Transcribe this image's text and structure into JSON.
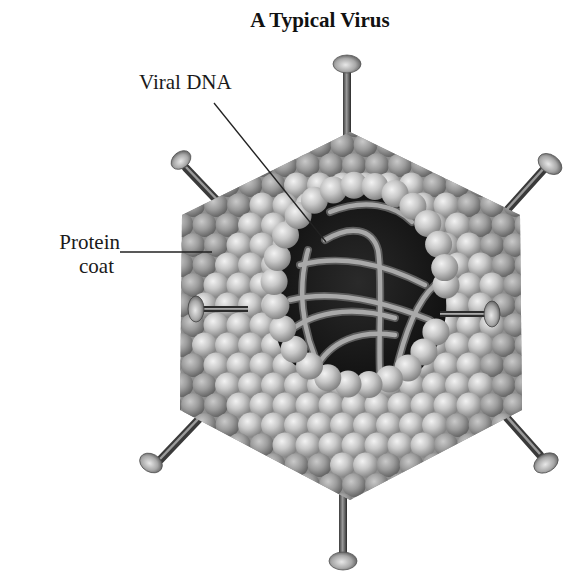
{
  "figure": {
    "title": "A Typical Virus",
    "labels": {
      "viral_dna": "Viral DNA",
      "protein_coat_line1": "Protein",
      "protein_coat_line2": "coat"
    },
    "parts": [
      {
        "name": "protein-coat",
        "description": "Capsid of spherical protein subunits arranged in a hexagonal (icosahedral) shell"
      },
      {
        "name": "viral-dna",
        "description": "Coiled DNA strands visible through an opening in the capsid"
      },
      {
        "name": "spike-fibers",
        "description": "Six fibers with knobbed heads projecting from the capsid vertices"
      }
    ],
    "colors": {
      "background": "#ffffff",
      "sphere_light": "#e6e6e6",
      "sphere_mid": "#b5b5b5",
      "sphere_dark": "#7a7a7a",
      "interior": "#1c1c1c",
      "dna": "#9a9a9a",
      "leader_line": "#222222"
    }
  }
}
